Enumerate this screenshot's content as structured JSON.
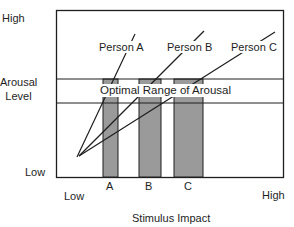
{
  "diagram": {
    "y_axis": {
      "high_label": "High",
      "title_line1": "Arousal",
      "title_line2": "Level",
      "low_label": "Low"
    },
    "x_axis": {
      "low_label": "Low",
      "high_label": "High",
      "title": "Stimulus Impact"
    },
    "band": {
      "label": "Optimal Range of Arousal"
    },
    "persons": [
      {
        "label": "Person A",
        "bar_label": "A"
      },
      {
        "label": "Person B",
        "bar_label": "B"
      },
      {
        "label": "Person C",
        "bar_label": "C"
      }
    ],
    "colors": {
      "line": "#1e1e1e",
      "bar_fill": "#9a9a9a",
      "background": "#ffffff"
    }
  }
}
